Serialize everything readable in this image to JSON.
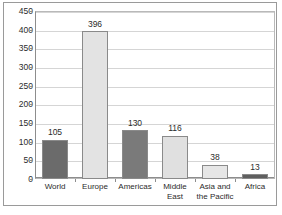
{
  "chart_data": {
    "type": "bar",
    "title": "",
    "xlabel": "",
    "ylabel": "",
    "ylim": [
      0,
      450
    ],
    "ytick_step": 50,
    "yticks": [
      "450",
      "400",
      "350",
      "300",
      "250",
      "200",
      "150",
      "100",
      "50",
      "0"
    ],
    "grid": true,
    "legend": "none",
    "categories": [
      "World",
      "Europe",
      "Americas",
      "Middle East",
      "Asia and the Pacific",
      "Africa"
    ],
    "values": [
      105,
      396,
      130,
      116,
      38,
      13
    ],
    "value_labels": [
      "105",
      "396",
      "130",
      "116",
      "38",
      "13"
    ],
    "bar_colors": [
      "#6b6b6b",
      "#e3e3e3",
      "#7a7a7a",
      "#e0e0e0",
      "#e6e6e6",
      "#5f5f5f"
    ],
    "bar_border_color": "#8a8a8a"
  },
  "colors": {
    "background": "#ffffff",
    "frame_border": "#9a9a9a",
    "plot_border": "#b9b9b9",
    "gridline": "#d5d5d5",
    "axis": "#8d8d8d",
    "text": "#2b2b2b"
  }
}
